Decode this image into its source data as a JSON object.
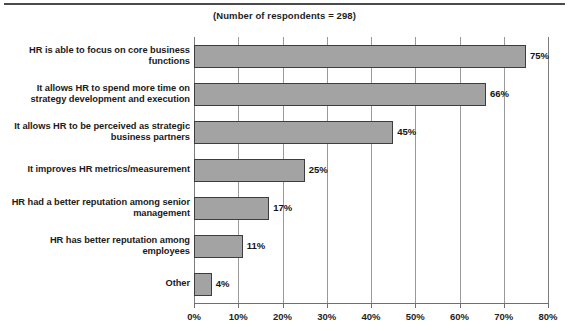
{
  "subtitle": "(Number of respondents = 298)",
  "chart_data": {
    "type": "bar",
    "orientation": "horizontal",
    "title": "",
    "subtitle": "(Number of respondents = 298)",
    "xlabel": "",
    "ylabel": "",
    "xlim": [
      0,
      80
    ],
    "grid": true,
    "legend": null,
    "value_suffix": "%",
    "categories": [
      "HR is able to focus on core business functions",
      "It allows HR to spend more time on strategy development and execution",
      "It allows HR to be perceived as strategic business partners",
      "It improves HR metrics/measurement",
      "HR had a better reputation among senior management",
      "HR has better reputation among employees",
      "Other"
    ],
    "values": [
      75,
      66,
      45,
      25,
      17,
      11,
      4
    ],
    "value_labels": [
      "75%",
      "66%",
      "45%",
      "25%",
      "17%",
      "11%",
      "4%"
    ],
    "xticks": [
      0,
      10,
      20,
      30,
      40,
      50,
      60,
      70,
      80
    ],
    "xtick_labels": [
      "0%",
      "10%",
      "20%",
      "30%",
      "40%",
      "50%",
      "60%",
      "70%",
      "80%"
    ],
    "bar_color": "#a3a3a3",
    "bar_border_color": "#3d3d3d",
    "gridline_color": "#9a9a9a",
    "axis_color": "#6f6f6f"
  }
}
